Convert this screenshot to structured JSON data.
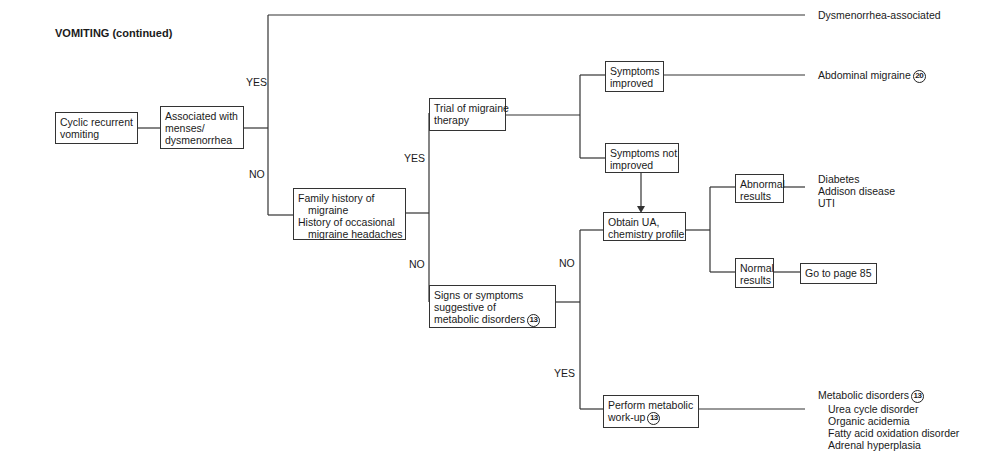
{
  "title": "VOMITING (continued)",
  "nodes": {
    "start": {
      "lines": [
        "Cyclic recurrent",
        "vomiting"
      ]
    },
    "menses": {
      "lines": [
        "Associated with",
        "menses/",
        "dysmenorrhea"
      ]
    },
    "family_history": {
      "lines": [
        "Family history of",
        "migraine",
        "History of occasional",
        "migraine headaches"
      ]
    },
    "trial": {
      "lines": [
        "Trial of migraine",
        "therapy"
      ]
    },
    "improved": {
      "lines": [
        "Symptoms",
        "improved"
      ]
    },
    "not_improved": {
      "lines": [
        "Symptoms not",
        "improved"
      ]
    },
    "signs": {
      "lines": [
        "Signs or symptoms",
        "suggestive of",
        "metabolic disorders"
      ],
      "ref": "13"
    },
    "obtain_ua": {
      "lines": [
        "Obtain UA,",
        "chemistry profile"
      ]
    },
    "abnormal": {
      "lines": [
        "Abnormal",
        "results"
      ]
    },
    "normal": {
      "lines": [
        "Normal",
        "results"
      ]
    },
    "goto": {
      "text": "Go to page 85"
    },
    "metabolic_workup": {
      "lines": [
        "Perform metabolic",
        "work-up"
      ],
      "ref": "13"
    }
  },
  "branch_labels": {
    "menses_yes": "YES",
    "menses_no": "NO",
    "family_yes": "YES",
    "family_no": "NO",
    "signs_no": "NO",
    "signs_yes": "YES"
  },
  "outcomes": {
    "dysmenorrhea": "Dysmenorrhea-associated",
    "abdominal_migraine": {
      "text": "Abdominal migraine",
      "ref": "20"
    },
    "abnormal_dx": [
      "Diabetes",
      "Addison disease",
      "UTI"
    ],
    "metabolic": {
      "heading": "Metabolic disorders",
      "ref": "13",
      "items": [
        "Urea cycle disorder",
        "Organic acidemia",
        "Fatty acid oxidation disorder",
        "Adrenal hyperplasia"
      ]
    }
  }
}
